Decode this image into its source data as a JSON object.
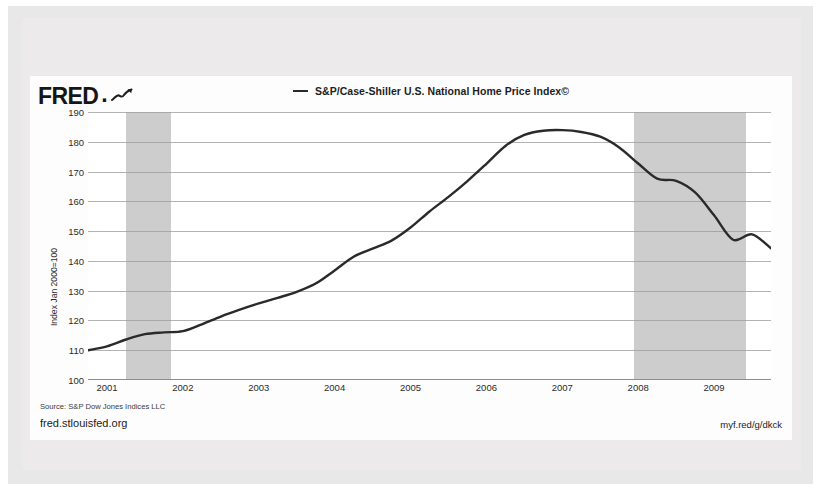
{
  "branding": {
    "logo_text": "FRED",
    "logo_dot": ".",
    "logo_icon": "line-chart-squiggle-icon",
    "url": "fred.stlouisfed.org",
    "short_url": "myf.red/g/dkck"
  },
  "legend": {
    "entries": [
      {
        "label": "S&P/Case-Shiller U.S. National Home Price Index©",
        "color": "#2a2a2a"
      }
    ]
  },
  "footer": {
    "source": "Source: S&P Dow Jones Indices LLC"
  },
  "colors": {
    "line": "#2a2a2a",
    "recession_band": "#cdcdcd",
    "gridline": "#9a9a9a",
    "plot_background": "#ffffff",
    "card_background": "#fdfdfd",
    "frame": "#e8e8e8",
    "page_background": "#ffffff"
  },
  "chart_data": {
    "type": "line",
    "title": "",
    "xlabel": "",
    "ylabel": "Index Jan 2000=100",
    "ylim": [
      100,
      190
    ],
    "yticks": [
      190,
      180,
      170,
      160,
      150,
      140,
      130,
      120,
      110,
      100
    ],
    "xlim": [
      2000.75,
      2009.75
    ],
    "xticks": [
      "2001",
      "2002",
      "2003",
      "2004",
      "2005",
      "2006",
      "2007",
      "2008",
      "2009"
    ],
    "xtick_values": [
      2001,
      2002,
      2003,
      2004,
      2005,
      2006,
      2007,
      2008,
      2009
    ],
    "grid": true,
    "legend_position": "top-center",
    "series": [
      {
        "name": "S&P/Case-Shiller U.S. National Home Price Index©",
        "color": "#2a2a2a",
        "x": [
          2000.75,
          2001.0,
          2001.25,
          2001.5,
          2001.75,
          2002.0,
          2002.25,
          2002.5,
          2002.75,
          2003.0,
          2003.25,
          2003.5,
          2003.75,
          2004.0,
          2004.25,
          2004.5,
          2004.75,
          2005.0,
          2005.25,
          2005.5,
          2005.75,
          2006.0,
          2006.25,
          2006.5,
          2006.75,
          2007.0,
          2007.25,
          2007.5,
          2007.75,
          2008.0,
          2008.25,
          2008.5,
          2008.75,
          2009.0,
          2009.25,
          2009.5,
          2009.75
        ],
        "y": [
          110.0,
          111.3,
          113.6,
          115.4,
          116.0,
          116.4,
          118.7,
          121.3,
          123.6,
          125.7,
          127.6,
          129.6,
          132.4,
          136.8,
          141.4,
          144.1,
          146.8,
          151.2,
          156.6,
          161.5,
          166.8,
          172.6,
          178.6,
          182.3,
          183.7,
          183.9,
          183.3,
          181.7,
          178.1,
          172.7,
          167.6,
          166.9,
          163.0,
          155.3,
          147.1,
          148.9,
          144.2
        ]
      }
    ],
    "shaded_regions": [
      {
        "name": "recession-2001",
        "x0": 2001.25,
        "x1": 2001.85
      },
      {
        "name": "recession-2007-2009",
        "x0": 2007.95,
        "x1": 2009.42
      }
    ],
    "annotations": []
  }
}
